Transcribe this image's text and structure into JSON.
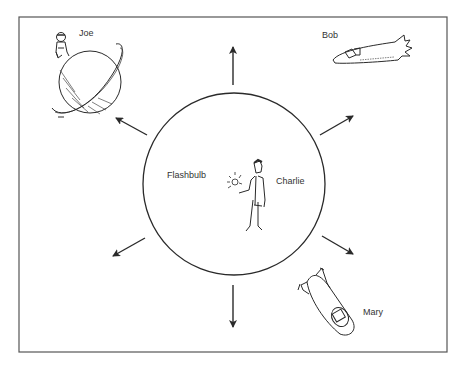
{
  "diagram": {
    "frame": {
      "x": 19,
      "y": 17,
      "width": 428,
      "height": 335
    },
    "center_circle": {
      "cx": 234,
      "cy": 184,
      "r": 91
    },
    "labels": {
      "joe": "Joe",
      "bob": "Bob",
      "flashbulb": "Flashbulb",
      "charlie": "Charlie",
      "mary": "Mary"
    },
    "arrows": [
      {
        "name": "up",
        "x1": 233,
        "y1": 85,
        "x2": 233,
        "y2": 47
      },
      {
        "name": "down",
        "x1": 233,
        "y1": 285,
        "x2": 233,
        "y2": 327
      },
      {
        "name": "upper-left",
        "x1": 147,
        "y1": 135,
        "x2": 116,
        "y2": 118
      },
      {
        "name": "upper-right",
        "x1": 320,
        "y1": 135,
        "x2": 353,
        "y2": 116
      },
      {
        "name": "lower-left",
        "x1": 145,
        "y1": 238,
        "x2": 113,
        "y2": 256
      },
      {
        "name": "lower-right",
        "x1": 322,
        "y1": 236,
        "x2": 353,
        "y2": 254
      }
    ],
    "colors": {
      "ink": "#2a2a2a",
      "background": "#ffffff"
    }
  }
}
